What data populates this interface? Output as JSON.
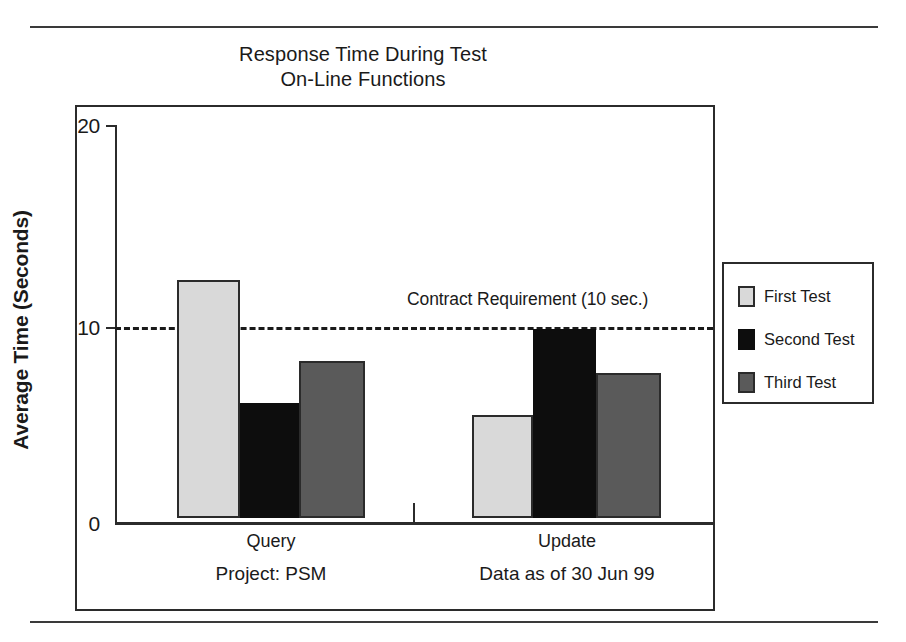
{
  "title": {
    "line1": "Response Time During Test",
    "line2": "On-Line Functions"
  },
  "axes": {
    "ylabel": "Average Time (Seconds)",
    "yticks": [
      "0",
      "10",
      "20"
    ],
    "ymin": 0,
    "ymax": 20
  },
  "annotation": {
    "contract": "Contract Requirement (10 sec.)"
  },
  "footers": {
    "left": "Project: PSM",
    "right": "Data as of 30 Jun 99"
  },
  "categories": {
    "query": "Query",
    "update": "Update"
  },
  "legend": {
    "items": [
      {
        "label": "First Test",
        "color": "#d9d9d9",
        "swatch": "first"
      },
      {
        "label": "Second Test",
        "color": "#0d0d0d",
        "swatch": "second"
      },
      {
        "label": "Third Test",
        "color": "#5a5a5a",
        "swatch": "third"
      }
    ]
  },
  "colors": {
    "first_test": "#d9d9d9",
    "second_test": "#0d0d0d",
    "third_test": "#5a5a5a",
    "ink": "#1a1a1a",
    "frame": "#2b2b2b"
  },
  "chart_data": {
    "type": "bar",
    "xlabel": "",
    "ylabel": "Average Time (Seconds)",
    "ylim": [
      0,
      20
    ],
    "yticks": [
      0,
      10,
      20
    ],
    "grid": false,
    "legend_position": "right",
    "categories": [
      "Query",
      "Update"
    ],
    "series": [
      {
        "name": "First Test",
        "values": [
          12.0,
          5.2
        ],
        "color": "#d9d9d9"
      },
      {
        "name": "Second Test",
        "values": [
          5.8,
          9.5
        ],
        "color": "#0d0d0d"
      },
      {
        "name": "Third Test",
        "values": [
          7.9,
          7.3
        ],
        "color": "#5a5a5a"
      }
    ],
    "annotations": [
      {
        "text": "Contract Requirement (10 sec.)",
        "type": "hline",
        "y": 10,
        "style": "dashed"
      }
    ],
    "footnotes": [
      "Project: PSM",
      "Data as of 30 Jun 99"
    ]
  }
}
